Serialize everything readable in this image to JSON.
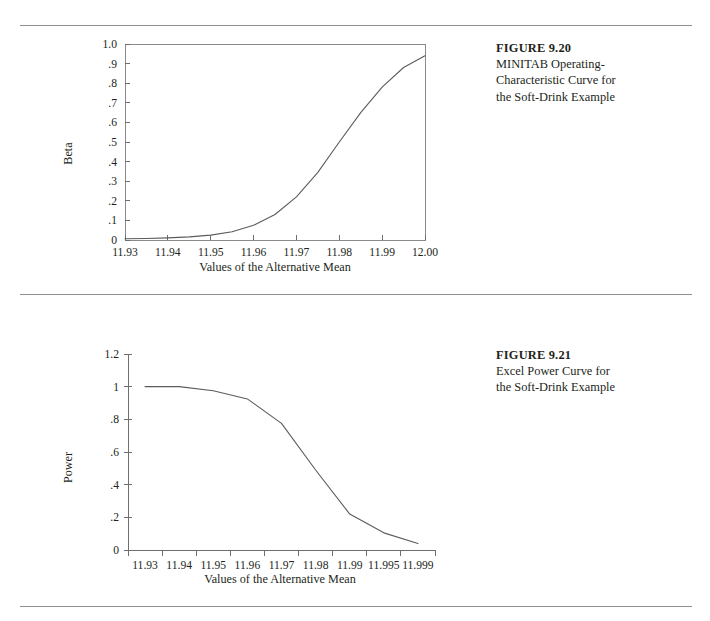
{
  "figures": [
    {
      "caption_title": "FIGURE 9.20",
      "caption_lines": [
        "MINITAB Operating-",
        "Characteristic Curve for",
        "the Soft-Drink Example"
      ]
    },
    {
      "caption_title": "FIGURE 9.21",
      "caption_lines": [
        "Excel Power Curve for",
        "the Soft-Drink Example"
      ]
    }
  ],
  "chart_data": [
    {
      "type": "line",
      "title": "",
      "xlabel": "Values of the Alternative Mean",
      "ylabel": "Beta",
      "xlim": [
        11.93,
        12.0
      ],
      "ylim": [
        0,
        1.0
      ],
      "grid": false,
      "frame": "box",
      "legend": "none",
      "xticks": [
        "11.93",
        "11.94",
        "11.95",
        "11.96",
        "11.97",
        "11.98",
        "11.99",
        "12.00"
      ],
      "yticks": [
        "1.0",
        ".9",
        ".8",
        ".7",
        ".6",
        ".5",
        ".4",
        ".3",
        ".2",
        ".1",
        "0"
      ],
      "series": [
        {
          "name": "Beta",
          "x": [
            11.93,
            11.935,
            11.94,
            11.945,
            11.95,
            11.955,
            11.96,
            11.965,
            11.97,
            11.975,
            11.98,
            11.985,
            11.99,
            11.995,
            12.0
          ],
          "values": [
            0.006,
            0.008,
            0.011,
            0.016,
            0.025,
            0.042,
            0.075,
            0.13,
            0.22,
            0.345,
            0.5,
            0.65,
            0.78,
            0.88,
            0.94
          ]
        }
      ]
    },
    {
      "type": "line",
      "title": "",
      "xlabel": "Values of the Alternative Mean",
      "ylabel": "Power",
      "xlim": [
        0,
        8
      ],
      "ylim": [
        0,
        1.2
      ],
      "grid": false,
      "frame": "L",
      "legend": "none",
      "categories": [
        "11.93",
        "11.94",
        "11.95",
        "11.96",
        "11.97",
        "11.98",
        "11.99",
        "11.995",
        "11.999"
      ],
      "yticks": [
        "1.2",
        "1",
        ".8",
        ".6",
        ".4",
        ".2",
        "0"
      ],
      "series": [
        {
          "name": "Power",
          "values": [
            1.0,
            1.0,
            0.975,
            0.925,
            0.775,
            0.49,
            0.22,
            0.105,
            0.04
          ]
        }
      ]
    }
  ],
  "colors": {
    "line": "#5b5b5f",
    "axis": "#6e6e72",
    "rule": "#8e8e90",
    "text": "#231f20"
  }
}
